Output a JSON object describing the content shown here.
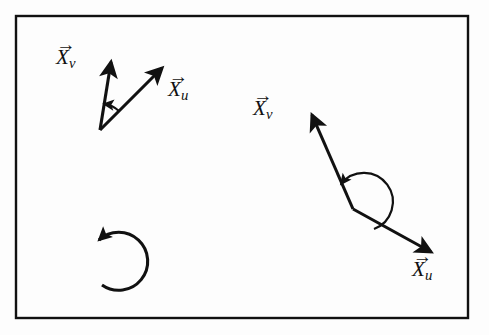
{
  "figure": {
    "background_color": "#fdfdfd",
    "ink_color": "#111111",
    "frame": {
      "name": "figure-border",
      "x": 15,
      "y": 15,
      "width": 454,
      "height": 304,
      "stroke_width": 2,
      "color": "#111111"
    },
    "groups": [
      {
        "id": "left-pair",
        "description": "Acute angle vector pair, arc arrow sweeping counterclockwise from X_u to X_v",
        "vertex": {
          "x": 100,
          "y": 130
        },
        "vectors": [
          {
            "id": "left-xv",
            "label_latex": "\\vec{X}_v",
            "base": "X",
            "harpoon": "→",
            "subscript": "v",
            "from": {
              "x": 100,
              "y": 130
            },
            "to": {
              "x": 111,
              "y": 60
            },
            "label_position": {
              "x": 56,
              "y": 50
            },
            "stroke_width": 3
          },
          {
            "id": "left-xu",
            "label_latex": "\\vec{X}_u",
            "base": "X",
            "harpoon": "→",
            "subscript": "u",
            "from": {
              "x": 100,
              "y": 130
            },
            "to": {
              "x": 164,
              "y": 66
            },
            "label_position": {
              "x": 168,
              "y": 82
            },
            "stroke_width": 3
          }
        ],
        "arc": {
          "id": "left-angle-arc",
          "type": "acute",
          "center": {
            "x": 100,
            "y": 130
          },
          "radius": 26,
          "direction": "counterclockwise",
          "from_vector": "left-xu",
          "to_vector": "left-xv"
        }
      },
      {
        "id": "right-pair",
        "description": "Reflex angle vector pair, arc arrow sweeping the long way around from X_u to X_v",
        "vertex": {
          "x": 353,
          "y": 209
        },
        "vectors": [
          {
            "id": "right-xv",
            "label_latex": "\\vec{X}_v",
            "base": "X",
            "harpoon": "→",
            "subscript": "v",
            "from": {
              "x": 353,
              "y": 209
            },
            "to": {
              "x": 310,
              "y": 112
            },
            "label_position": {
              "x": 253,
              "y": 100
            },
            "stroke_width": 3
          },
          {
            "id": "right-xu",
            "label_latex": "\\vec{X}_u",
            "base": "X",
            "harpoon": "→",
            "subscript": "u",
            "from": {
              "x": 353,
              "y": 209
            },
            "to": {
              "x": 433,
              "y": 254
            },
            "label_position": {
              "x": 412,
              "y": 262
            },
            "stroke_width": 3
          }
        ],
        "arc": {
          "id": "right-angle-arc",
          "type": "reflex",
          "center": {
            "x": 353,
            "y": 209
          },
          "radius": 29,
          "direction": "counterclockwise-reflex",
          "from_vector": "right-xu",
          "to_vector": "right-xv"
        }
      }
    ],
    "orientation_circle": {
      "id": "orientation-circle",
      "description": "Counterclockwise circular arrow indicating positive orientation",
      "center": {
        "x": 123,
        "y": 263
      },
      "radius": 29,
      "direction": "counterclockwise",
      "gap_side": "left",
      "stroke_width": 3,
      "arrowhead_at": {
        "x": 97,
        "y": 243
      }
    }
  }
}
